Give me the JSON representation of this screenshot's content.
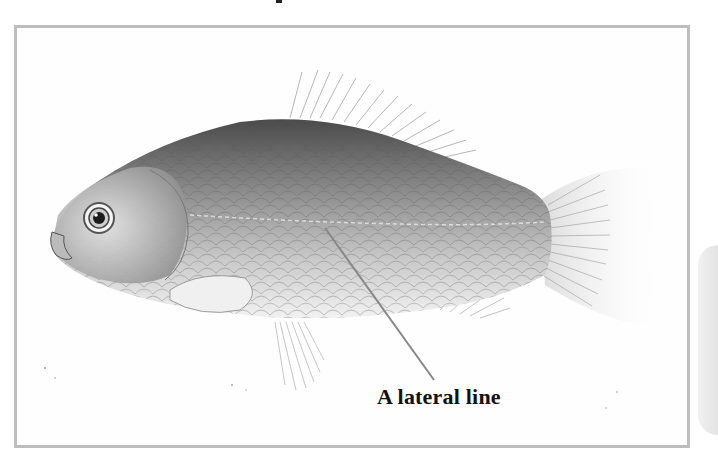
{
  "figure": {
    "annotations": [
      {
        "label": "A lateral line",
        "points_to": "lateral-line"
      }
    ],
    "colors": {
      "frame_border": "#bdbdbd",
      "leader_line": "#888888",
      "label_text": "#111111",
      "background": "#ffffff"
    }
  }
}
